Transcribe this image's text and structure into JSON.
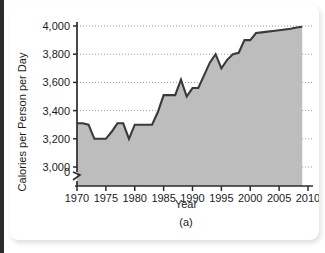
{
  "figure": {
    "caption": "(a)",
    "panel_letter": "(a)"
  },
  "chart_data": {
    "type": "area",
    "title": "",
    "xlabel": "Year",
    "ylabel": "Calories per Person per Day",
    "xlim": [
      1970,
      2010
    ],
    "ylim": [
      3000,
      4000
    ],
    "y_axis_break": true,
    "y_break_label": "0",
    "grid": true,
    "grid_style": "dotted-horizontal",
    "legend": "none",
    "line_color": "#3a3a3a",
    "fill_color": "#bdbdbd",
    "axis_color": "#2b2b2b",
    "grid_color": "#9a9a9a",
    "xticks": [
      1970,
      1975,
      1980,
      1985,
      1990,
      1995,
      2000,
      2005,
      2010
    ],
    "xtick_labels": [
      "1970",
      "1975",
      "1980",
      "1985",
      "1990",
      "1995",
      "2000",
      "2005",
      "2010"
    ],
    "yticks": [
      3000,
      3200,
      3400,
      3600,
      3800,
      4000
    ],
    "ytick_labels": [
      "3,000",
      "3,200",
      "3,400",
      "3,600",
      "3,800",
      "4,000"
    ],
    "x": [
      1970,
      1971,
      1972,
      1973,
      1974,
      1975,
      1976,
      1977,
      1978,
      1979,
      1980,
      1981,
      1982,
      1983,
      1984,
      1985,
      1986,
      1987,
      1988,
      1989,
      1990,
      1991,
      1992,
      1993,
      1994,
      1995,
      1996,
      1997,
      1998,
      1999,
      2000,
      2001,
      2002,
      2003,
      2004,
      2005,
      2006,
      2007,
      2008,
      2009
    ],
    "values": [
      3310,
      3310,
      3300,
      3200,
      3200,
      3200,
      3250,
      3310,
      3310,
      3200,
      3300,
      3300,
      3300,
      3300,
      3390,
      3510,
      3510,
      3510,
      3620,
      3500,
      3560,
      3560,
      3650,
      3740,
      3800,
      3700,
      3760,
      3800,
      3810,
      3900,
      3900,
      3950,
      3955,
      3960,
      3965,
      3970,
      3975,
      3980,
      3990,
      3995
    ]
  }
}
